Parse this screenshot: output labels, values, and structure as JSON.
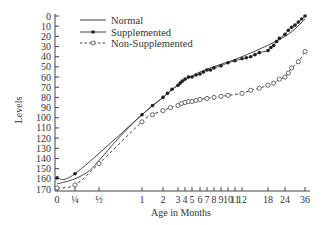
{
  "chart_data": {
    "type": "line",
    "title": "",
    "xlabel": "Age in Months",
    "ylabel": "Levels",
    "y_inverted": true,
    "ylim": [
      0,
      170
    ],
    "yticks": [
      0,
      10,
      20,
      30,
      40,
      50,
      60,
      70,
      80,
      90,
      100,
      110,
      120,
      130,
      140,
      150,
      160,
      170
    ],
    "xticks": [
      {
        "value": 0,
        "label": "0"
      },
      {
        "value": 0.25,
        "label": "¼"
      },
      {
        "value": 0.5,
        "label": "½"
      },
      {
        "value": 1,
        "label": "1"
      },
      {
        "value": 2,
        "label": "2"
      },
      {
        "value": 3,
        "label": "3"
      },
      {
        "value": 4,
        "label": "4"
      },
      {
        "value": 5,
        "label": "5"
      },
      {
        "value": 6,
        "label": "6"
      },
      {
        "value": 7,
        "label": "7"
      },
      {
        "value": 8,
        "label": "8"
      },
      {
        "value": 9,
        "label": "9"
      },
      {
        "value": 10,
        "label": "10"
      },
      {
        "value": 11,
        "label": "11"
      },
      {
        "value": 12,
        "label": "12"
      },
      {
        "value": 18,
        "label": "18"
      },
      {
        "value": 24,
        "label": "24"
      },
      {
        "value": 36,
        "label": "36"
      }
    ],
    "grid": false,
    "legend": "top-left",
    "series": [
      {
        "name": "Normal",
        "style": "solid",
        "marker": "none",
        "points": [
          [
            0,
            165
          ],
          [
            0.25,
            160
          ],
          [
            0.4,
            152
          ],
          [
            0.5,
            142
          ],
          [
            0.75,
            118
          ],
          [
            1,
            97
          ],
          [
            2,
            80
          ],
          [
            3,
            68
          ],
          [
            6,
            55
          ],
          [
            12,
            40
          ],
          [
            24,
            20
          ],
          [
            36,
            3
          ]
        ]
      },
      {
        "name": "Supplemented",
        "style": "solid",
        "marker": "filled-circle",
        "points": [
          [
            0,
            159
          ],
          [
            0.25,
            155
          ],
          [
            1,
            97
          ],
          [
            1.5,
            88
          ],
          [
            2,
            80
          ],
          [
            2.3,
            76
          ],
          [
            2.6,
            72
          ],
          [
            3,
            68
          ],
          [
            3.3,
            66
          ],
          [
            3.6,
            64
          ],
          [
            4,
            62
          ],
          [
            4.5,
            60
          ],
          [
            5,
            60
          ],
          [
            5.5,
            58
          ],
          [
            6,
            57
          ],
          [
            6.5,
            55
          ],
          [
            7,
            53
          ],
          [
            7.5,
            53
          ],
          [
            8,
            51
          ],
          [
            9,
            49
          ],
          [
            10,
            46
          ],
          [
            11,
            44
          ],
          [
            12,
            42
          ],
          [
            13,
            41
          ],
          [
            14,
            40
          ],
          [
            15,
            38
          ],
          [
            16,
            36
          ],
          [
            18,
            34
          ],
          [
            19,
            31
          ],
          [
            20,
            29
          ],
          [
            21,
            25
          ],
          [
            22,
            22
          ],
          [
            24,
            18
          ],
          [
            26,
            14
          ],
          [
            28,
            11
          ],
          [
            30,
            9
          ],
          [
            32,
            6
          ],
          [
            34,
            3
          ],
          [
            36,
            0
          ]
        ]
      },
      {
        "name": "Non-Supplemented",
        "style": "dashed",
        "marker": "open-circle",
        "points": [
          [
            0,
            169
          ],
          [
            0.25,
            166
          ],
          [
            0.5,
            145
          ],
          [
            1,
            104
          ],
          [
            1.5,
            97
          ],
          [
            2,
            93
          ],
          [
            2.5,
            90
          ],
          [
            3,
            88
          ],
          [
            3.5,
            86
          ],
          [
            4,
            85
          ],
          [
            4.5,
            84
          ],
          [
            5,
            84
          ],
          [
            5.5,
            83
          ],
          [
            6,
            82
          ],
          [
            7,
            81
          ],
          [
            8,
            80
          ],
          [
            9,
            79
          ],
          [
            10,
            78
          ],
          [
            12,
            76
          ],
          [
            14,
            73
          ],
          [
            16,
            71
          ],
          [
            18,
            68
          ],
          [
            20,
            66
          ],
          [
            22,
            62
          ],
          [
            24,
            60
          ],
          [
            26,
            56
          ],
          [
            28,
            51
          ],
          [
            32,
            45
          ],
          [
            36,
            35
          ]
        ]
      }
    ]
  }
}
